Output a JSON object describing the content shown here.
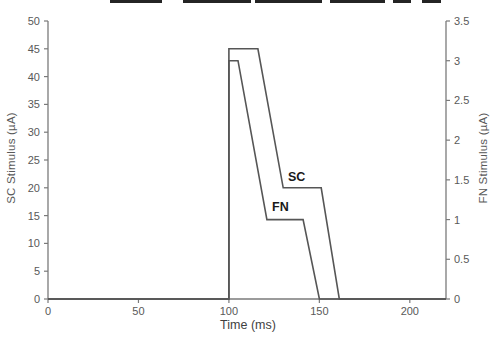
{
  "chart_data": {
    "type": "line",
    "title": "",
    "xlabel": "Time (ms)",
    "ylabel_left": "SC Stimulus (µA)",
    "ylabel_right": "FN Stimulus (µA)",
    "xlim": [
      0,
      220
    ],
    "ylim_left": [
      0,
      50
    ],
    "ylim_right": [
      0,
      3.5
    ],
    "grid": false,
    "legend": "inline-labels",
    "x_ticks": [
      0,
      50,
      100,
      150,
      200
    ],
    "x_tick_labels": [
      "0",
      "50",
      "100",
      "150",
      "200"
    ],
    "y_ticks_left": [
      0,
      5,
      10,
      15,
      20,
      25,
      30,
      35,
      40,
      45,
      50
    ],
    "y_tick_labels_left": [
      "0",
      "5",
      "10",
      "15",
      "20",
      "25",
      "30",
      "35",
      "40",
      "45",
      "50"
    ],
    "y_ticks_right": [
      0,
      0.5,
      1,
      1.5,
      2,
      2.5,
      3,
      3.5
    ],
    "y_tick_labels_right": [
      "0",
      "0.5",
      "1",
      "1.5",
      "2",
      "2.5",
      "3",
      "3.5"
    ],
    "series": [
      {
        "name": "SC",
        "axis": "left",
        "color": "#565656",
        "points": [
          [
            0,
            0
          ],
          [
            100,
            0
          ],
          [
            100,
            45
          ],
          [
            116,
            45
          ],
          [
            130,
            20
          ],
          [
            151,
            20
          ],
          [
            161,
            0
          ],
          [
            220,
            0
          ]
        ],
        "description": "SC stimulus ramp: step to 45 µA at 100 ms, hold to 116 ms, ramp down to 20 µA at 130 ms, hold to 151 ms, ramp to 0 µA at 161 ms"
      },
      {
        "name": "FN",
        "axis": "right",
        "color": "#565656",
        "points": [
          [
            0,
            0
          ],
          [
            100,
            0
          ],
          [
            100,
            3
          ],
          [
            105,
            3
          ],
          [
            121,
            1
          ],
          [
            141,
            1
          ],
          [
            150,
            0
          ],
          [
            220,
            0
          ]
        ],
        "description": "FN stimulus ramp: step to 3 µA at 100 ms, hold to 105 ms, ramp down to 1 µA at 121 ms, hold to 141 ms, ramp to 0 µA at 150 ms"
      }
    ],
    "colors": {
      "axis_line": "#7a7a7a",
      "tick_text": "#595959",
      "series_line": "#565656",
      "series_label_text": "#1a1a1a",
      "x_title_text": "#3f3f3f",
      "artifact_bar": "#242424"
    }
  },
  "artifacts": {
    "cropped_title_segments": [
      [
        110,
        52
      ],
      [
        183,
        68
      ],
      [
        255,
        67
      ],
      [
        330,
        55
      ],
      [
        393,
        18
      ],
      [
        422,
        19
      ]
    ]
  }
}
